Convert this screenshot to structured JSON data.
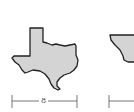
{
  "figure": {
    "shapes": [
      {
        "name": "texas-outline",
        "fill": "#d4d4d4",
        "stroke": "#222222"
      },
      {
        "name": "partial-shape-right",
        "fill": "#d4d4d4",
        "stroke": "#222222"
      }
    ],
    "dimensions": [
      {
        "label": "8"
      }
    ]
  }
}
